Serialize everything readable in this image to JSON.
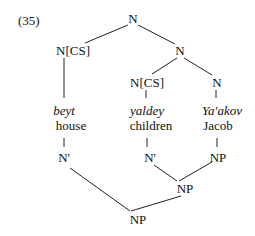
{
  "example_number": "(35)",
  "nodes": {
    "root": "N",
    "n_cs_left": "N[CS]",
    "n_mid": "N",
    "n_cs_mid": "N[CS]",
    "n_right": "N",
    "word1": "beyt",
    "gloss1": "house",
    "word2": "yaldey",
    "gloss2": "children",
    "word3": "Ya'akov",
    "gloss3": "Jacob",
    "nbar1": "N'",
    "nbar2": "N'",
    "np3": "NP",
    "np_mid": "NP",
    "np_root": "NP"
  }
}
